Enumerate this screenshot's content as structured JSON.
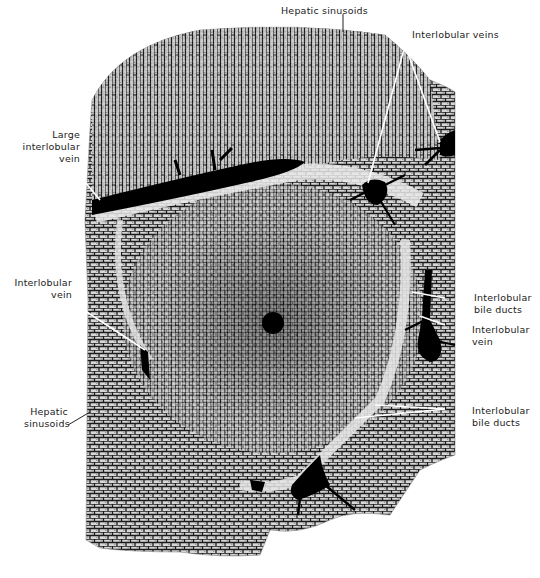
{
  "figure": {
    "labels": {
      "hepatic_sinusoids_top": "Hepatic sinusoids",
      "interlobular_veins_top": "Interlobular veins",
      "large_interlobular_vein": "Large\ninterlobular\nvein",
      "interlobular_vein_left": "Interlobular\nvein",
      "hepatic_sinusoids_left": "Hepatic\nsinusoids",
      "interlobular_bile_ducts_right_upper": "Interlobular\nbile ducts",
      "interlobular_vein_right": "Interlobular\nvein",
      "interlobular_bile_ducts_right_lower": "Interlobular\nbile ducts"
    },
    "colors": {
      "tissue_light": "#cfcfcf",
      "tissue_dark": "#1a1a1a",
      "vessel": "#000000",
      "background": "#ffffff"
    }
  }
}
